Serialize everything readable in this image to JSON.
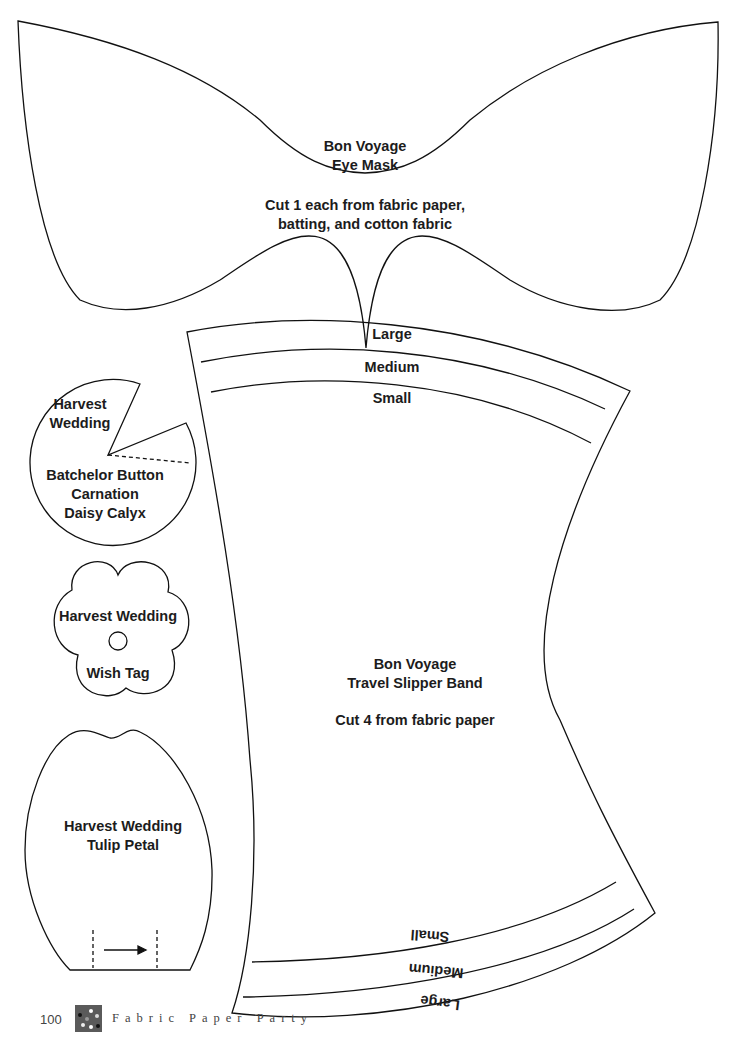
{
  "eye_mask": {
    "title_line1": "Bon Voyage",
    "title_line2": "Eye Mask",
    "instruction_line1": "Cut 1 each from fabric paper,",
    "instruction_line2": "batting, and cotton fabric"
  },
  "slipper_band": {
    "top_sizes": [
      "Large",
      "Medium",
      "Small"
    ],
    "bottom_sizes": [
      "Small",
      "Medium",
      "Large"
    ],
    "title_line1": "Bon Voyage",
    "title_line2": "Travel Slipper Band",
    "instruction": "Cut 4 from fabric paper"
  },
  "flower_circle": {
    "label_top_line1": "Harvest",
    "label_top_line2": "Wedding",
    "label_bottom_line1": "Batchelor Button",
    "label_bottom_line2": "Carnation",
    "label_bottom_line3": "Daisy Calyx"
  },
  "wish_tag": {
    "label_line1": "Harvest Wedding",
    "label_line2": "Wish Tag"
  },
  "tulip_petal": {
    "label_line1": "Harvest Wedding",
    "label_line2": "Tulip Petal",
    "grainline_icon": "arrow-right-icon"
  },
  "footer": {
    "page_number": "100",
    "book_title": "Fabric Paper Party"
  },
  "colors": {
    "line": "#111111",
    "text": "#1c1c1c",
    "footer_text": "#444444",
    "swatch": "#5a5a5a"
  }
}
